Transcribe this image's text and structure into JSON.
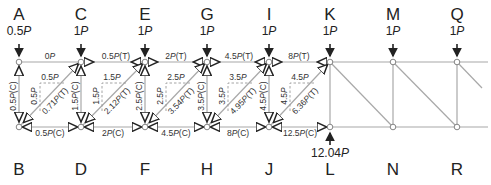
{
  "top_nodes": [
    {
      "id": "A",
      "x": 19,
      "load": "0.5",
      "unit": "P"
    },
    {
      "id": "C",
      "x": 81,
      "load": "1",
      "unit": "P"
    },
    {
      "id": "E",
      "x": 145,
      "load": "1",
      "unit": "P"
    },
    {
      "id": "G",
      "x": 207,
      "load": "1",
      "unit": "P"
    },
    {
      "id": "I",
      "x": 269,
      "load": "1",
      "unit": "P"
    },
    {
      "id": "K",
      "x": 330,
      "load": "1",
      "unit": "P"
    },
    {
      "id": "M",
      "x": 393,
      "load": "1",
      "unit": "P"
    },
    {
      "id": "Q",
      "x": 457,
      "load": "1",
      "unit": "P"
    }
  ],
  "bottom_nodes": [
    {
      "id": "B",
      "x": 19
    },
    {
      "id": "D",
      "x": 81
    },
    {
      "id": "F",
      "x": 145
    },
    {
      "id": "H",
      "x": 207
    },
    {
      "id": "J",
      "x": 269
    },
    {
      "id": "L",
      "x": 330
    },
    {
      "id": "N",
      "x": 393
    },
    {
      "id": "R",
      "x": 457
    }
  ],
  "reaction": {
    "node": "L",
    "value": "12.04",
    "unit": "P"
  },
  "top_chord_forces": [
    {
      "text": "0P",
      "num": "0",
      "suffix": ""
    },
    {
      "text": "0.5P(T)",
      "num": "0.5",
      "suffix": "(T)"
    },
    {
      "text": "2P(T)",
      "num": "2",
      "suffix": "(T)"
    },
    {
      "text": "4.5P(T)",
      "num": "4.5",
      "suffix": "(T)"
    },
    {
      "text": "8P(T)",
      "num": "8",
      "suffix": "(T)"
    }
  ],
  "bottom_chord_forces": [
    {
      "text": "0.5P(C)",
      "num": "0.5",
      "suffix": "(C)"
    },
    {
      "text": "2P(C)",
      "num": "2",
      "suffix": "(C)"
    },
    {
      "text": "4.5P(C)",
      "num": "4.5",
      "suffix": "(C)"
    },
    {
      "text": "8P(C)",
      "num": "8",
      "suffix": "(C)"
    },
    {
      "text": "12.5P(C)",
      "num": "12.5",
      "suffix": "(C)"
    }
  ],
  "vertical_forces": [
    {
      "text": "0.5P(C)",
      "num": "0.5",
      "suffix": "(C)"
    },
    {
      "text": "1.5P(C)",
      "num": "1.5",
      "suffix": "(C)"
    },
    {
      "text": "2.5P(C)",
      "num": "2.5",
      "suffix": "(C)"
    },
    {
      "text": "3.5P(C)",
      "num": "3.5",
      "suffix": "(C)"
    },
    {
      "text": "4.5P(C)",
      "num": "4.5",
      "suffix": "(C)"
    }
  ],
  "diagonal_forces": [
    {
      "text": "0.71P(T)",
      "num": "0.71",
      "suffix": "(T)"
    },
    {
      "text": "2.12P(T)",
      "num": "2.12",
      "suffix": "(T)"
    },
    {
      "text": "3.54P(T)",
      "num": "3.54",
      "suffix": "(T)"
    },
    {
      "text": "4.95P(T)",
      "num": "4.95",
      "suffix": "(T)"
    },
    {
      "text": "6.36P(T)",
      "num": "6.36",
      "suffix": "(T)"
    }
  ],
  "component_labels": [
    {
      "h": "0.5",
      "v": "0.5",
      "unit": "P"
    },
    {
      "h": "1.5",
      "v": "1.5",
      "unit": "P"
    },
    {
      "h": "2.5",
      "v": "2.5",
      "unit": "P"
    },
    {
      "h": "3.5",
      "v": "3.5",
      "unit": "P"
    },
    {
      "h": "4.5",
      "v": "4.5",
      "unit": "P"
    }
  ],
  "colors": {
    "member": "#a8a8a8",
    "arrow": "#222222",
    "dash": "#9a9a9a",
    "node_fill": "#ffffff"
  }
}
